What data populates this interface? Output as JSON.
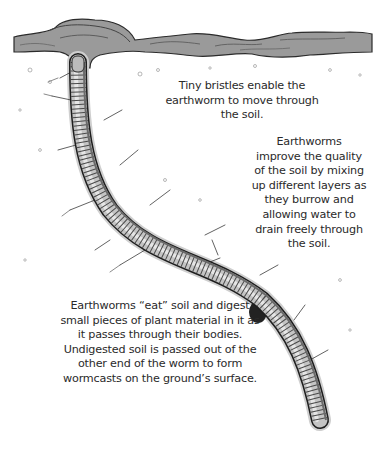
{
  "illustration": {
    "subject": "Cross-section of soil showing an earthworm in its burrow",
    "colors": {
      "background": "#ffffff",
      "soil_surface": "#8a8a8a",
      "worm_body": "#bdbdbd",
      "worm_outline": "#1e1e1e",
      "text": "#2a2a2a"
    }
  },
  "captions": {
    "bristles": {
      "lines": [
        "Tiny bristles enable the",
        "earthworm to move through",
        "the soil."
      ]
    },
    "improve": {
      "lines": [
        "Earthworms",
        "improve the quality",
        "of the soil by mixing",
        "up different layers as",
        "they burrow and",
        "allowing water to",
        "drain freely through",
        "the soil."
      ]
    },
    "eat": {
      "lines": [
        "Earthworms “eat” soil and digest",
        "small pieces of plant material in it as",
        "it passes through their bodies.",
        "Undigested soil is passed out of the",
        "other end of the worm to form",
        "wormcasts on the ground’s surface."
      ]
    }
  }
}
